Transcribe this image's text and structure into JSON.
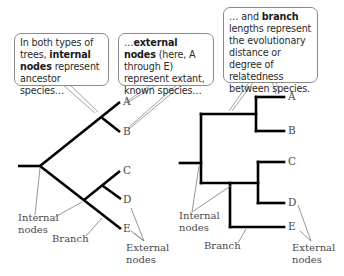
{
  "callouts": {
    "internal": {
      "pre": "In both types of trees, ",
      "bold": "internal nodes",
      "post": " represent ancestor species…"
    },
    "external": {
      "pre": "…",
      "bold": "external nodes",
      "post": " (here, A through E) represent extant, known species…"
    },
    "branch": {
      "pre": "… and ",
      "bold": "branch",
      "post": " lengths represent the evolutionary distance or degree of relatedness between species."
    }
  },
  "left_tree": {
    "leaves": [
      "A",
      "B",
      "C",
      "D",
      "E"
    ],
    "labels": {
      "internal_nodes_1": "Internal",
      "internal_nodes_2": "nodes",
      "branch": "Branch",
      "external_nodes_1": "External",
      "external_nodes_2": "nodes"
    }
  },
  "right_tree": {
    "leaves": [
      "A",
      "B",
      "C",
      "D",
      "E"
    ],
    "labels": {
      "internal_nodes_1": "Internal",
      "internal_nodes_2": "nodes",
      "branch": "Branch",
      "external_nodes_1": "External",
      "external_nodes_2": "nodes"
    }
  },
  "colors": {
    "branch_line": "#000000",
    "pointer_line": "#7a7a7a",
    "callout_border": "#8a8a8a",
    "label_text": "#4a4a4a"
  }
}
